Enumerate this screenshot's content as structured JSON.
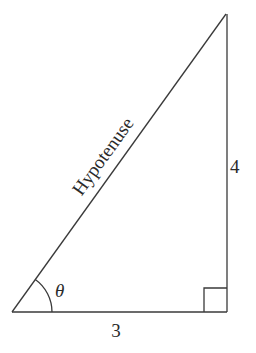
{
  "diagram": {
    "type": "right-triangle",
    "labels": {
      "hypotenuse": "Hypotenuse",
      "vertical_side": "4",
      "horizontal_side": "3",
      "angle": "θ"
    },
    "vertices": {
      "bottom_left": [
        12,
        312
      ],
      "bottom_right": [
        227,
        312
      ],
      "top_right": [
        226,
        14
      ]
    },
    "right_angle_marker": "bottom_right",
    "angle_marker": "bottom_left"
  }
}
